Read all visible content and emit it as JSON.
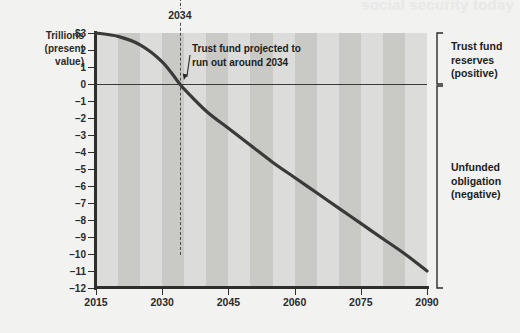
{
  "figure": {
    "ghost_text": "social security today",
    "axis_title_lines": [
      "Trillions",
      "(present",
      "value)"
    ],
    "year_marker_label": "2034",
    "annotation": {
      "line1": "Trust fund projected to",
      "line2": "run out around 2034"
    },
    "brackets": {
      "upper": {
        "line1": "Trust fund",
        "line2": "reserves",
        "line3": "(positive)"
      },
      "lower": {
        "line1": "Unfunded",
        "line2": "obligation",
        "line3": "(negative)"
      }
    },
    "colors": {
      "background": "#f2f2f1",
      "band_light": "#dcdcda",
      "band_dark": "#c9c9c6",
      "axis": "#2e2e2c",
      "curve": "#3a3a38",
      "text": "#1e1e1c"
    }
  },
  "chart_data": {
    "type": "line",
    "title": "",
    "subtitle": "",
    "xlabel": "",
    "ylabel": "Trillions (present value)",
    "xlim": [
      2015,
      2090
    ],
    "ylim": [
      -12,
      3
    ],
    "xticks": [
      2015,
      2030,
      2045,
      2060,
      2075,
      2090
    ],
    "yticks": [
      3,
      2,
      1,
      0,
      -1,
      -2,
      -3,
      -4,
      -5,
      -6,
      -7,
      -8,
      -9,
      -10,
      -11,
      -12
    ],
    "ytick_labels": [
      "$3",
      "2",
      "1",
      "0",
      "-1",
      "-2",
      "-3",
      "-4",
      "-5",
      "-6",
      "-7",
      "-8",
      "-9",
      "-10",
      "-11",
      "-12"
    ],
    "grid": false,
    "legend": null,
    "alternating_bands_years": 5,
    "zero_line": 0,
    "reference_line": {
      "x": 2034,
      "label": "2034",
      "style": "dashed"
    },
    "annotations": [
      {
        "text": "Trust fund projected to run out around 2034",
        "points_to_x": 2034,
        "points_to_y": 0
      },
      {
        "text": "Trust fund reserves (positive)",
        "y_range": [
          0,
          3
        ]
      },
      {
        "text": "Unfunded obligation (negative)",
        "y_range": [
          -12,
          0
        ]
      }
    ],
    "series": [
      {
        "name": "Social Security trust fund balance (trillions, present value)",
        "x": [
          2015,
          2020,
          2025,
          2030,
          2034,
          2035,
          2040,
          2045,
          2050,
          2055,
          2060,
          2065,
          2070,
          2075,
          2080,
          2085,
          2090
        ],
        "values": [
          3.0,
          2.8,
          2.3,
          1.3,
          0.0,
          -0.3,
          -1.6,
          -2.6,
          -3.6,
          -4.6,
          -5.5,
          -6.4,
          -7.3,
          -8.2,
          -9.1,
          -10.0,
          -11.0
        ]
      }
    ]
  }
}
